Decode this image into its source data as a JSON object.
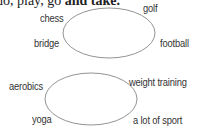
{
  "heading": {
    "prefix": "do, play, go ",
    "bold": "and take."
  },
  "diagram1": {
    "labels": {
      "top_left": "chess",
      "top_right": "golf",
      "bottom_left": "bridge",
      "bottom_right": "football"
    }
  },
  "diagram2": {
    "labels": {
      "top_left": "aerobics",
      "top_right": "weight training",
      "bottom_left": "yoga",
      "bottom_right": "a lot of sport"
    }
  }
}
